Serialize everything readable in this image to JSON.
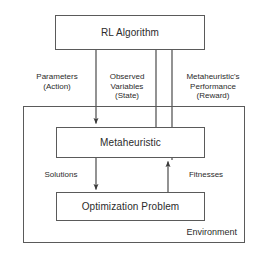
{
  "diagram": {
    "colors": {
      "stroke": "#5a5a5a",
      "arrow": "#3a3a3a",
      "text": "#2b2b2b",
      "background": "#ffffff"
    },
    "nodes": {
      "rl_algorithm": {
        "label": "RL Algorithm"
      },
      "metaheuristic": {
        "label": "Metaheuristic"
      },
      "optimization_problem": {
        "label": "Optimization Problem"
      },
      "environment": {
        "label": "Environment"
      }
    },
    "edges": {
      "parameters": {
        "line1": "Parameters",
        "line2": "(Action)"
      },
      "observed": {
        "line1": "Observed",
        "line2": "Variables",
        "line3": "(State)"
      },
      "performance": {
        "line1": "Metaheuristic's",
        "line2": "Performance",
        "line3": "(Reward)"
      },
      "solutions": {
        "label": "Solutions"
      },
      "fitnesses": {
        "label": "Fitnesses"
      }
    }
  }
}
